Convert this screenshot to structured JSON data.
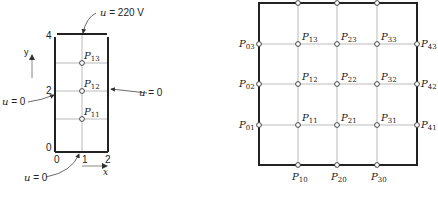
{
  "left_diagram": {
    "boundary_top": {
      "var": "u",
      "eq": " = 220 V"
    },
    "boundary_right": {
      "var": "u",
      "eq": " = 0"
    },
    "boundary_left": {
      "var": "u",
      "eq": " = 0"
    },
    "boundary_bottom": {
      "var": "u",
      "eq": " = 0"
    },
    "y_ticks": [
      "4",
      "2",
      "0"
    ],
    "x_ticks": [
      "0",
      "1",
      "2"
    ],
    "x_axis_label": "x",
    "y_axis_label": "y",
    "points": [
      {
        "base": "P",
        "sub": "13"
      },
      {
        "base": "P",
        "sub": "12"
      },
      {
        "base": "P",
        "sub": "11"
      }
    ]
  },
  "right_diagram": {
    "left_points": [
      {
        "base": "P",
        "sub": "03"
      },
      {
        "base": "P",
        "sub": "02"
      },
      {
        "base": "P",
        "sub": "01"
      }
    ],
    "right_points": [
      {
        "base": "P",
        "sub": "43"
      },
      {
        "base": "P",
        "sub": "42"
      },
      {
        "base": "P",
        "sub": "41"
      }
    ],
    "bottom_points": [
      {
        "base": "P",
        "sub": "10"
      },
      {
        "base": "P",
        "sub": "20"
      },
      {
        "base": "P",
        "sub": "30"
      }
    ],
    "interior_points": [
      {
        "base": "P",
        "sub": "13"
      },
      {
        "base": "P",
        "sub": "23"
      },
      {
        "base": "P",
        "sub": "33"
      },
      {
        "base": "P",
        "sub": "12"
      },
      {
        "base": "P",
        "sub": "22"
      },
      {
        "base": "P",
        "sub": "32"
      },
      {
        "base": "P",
        "sub": "11"
      },
      {
        "base": "P",
        "sub": "21"
      },
      {
        "base": "P",
        "sub": "31"
      }
    ]
  }
}
